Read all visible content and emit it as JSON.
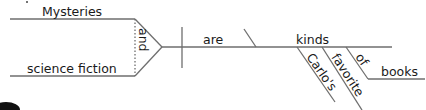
{
  "diagram": {
    "type": "sentence-diagram",
    "sentence": "Mysteries and science fiction are Carlo's favorite kinds of books.",
    "subjects": [
      "Mysteries",
      "science fiction"
    ],
    "conjunction": "and",
    "verb": "are",
    "predicate_noun": "kinds",
    "modifiers": [
      "Carlo's",
      "favorite"
    ],
    "preposition": "of",
    "object_of_preposition": "books",
    "colors": {
      "line": "#6e6e6e",
      "text": "#1a1a1a",
      "background": "#ffffff"
    }
  }
}
